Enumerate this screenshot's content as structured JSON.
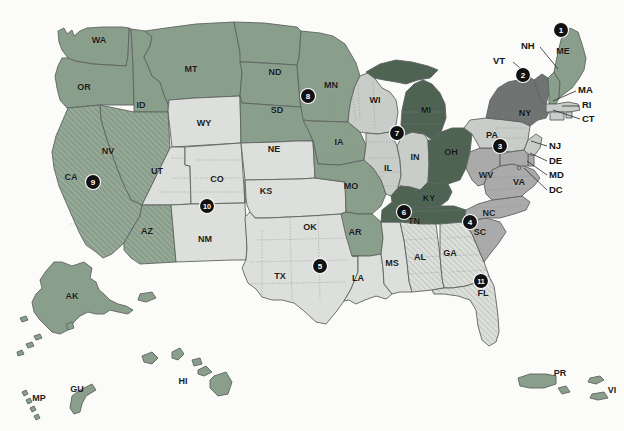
{
  "map": {
    "title": "United States choropleth map with numbered region markers",
    "background_color": "#fbfbfa",
    "legend_colors": {
      "darkest_green": "#4f6352",
      "medium_green": "#8a9e8c",
      "dark_gray": "#6f7472",
      "gray": "#a9aaa9",
      "light_gray": "#c9cdc9",
      "palest_gray": "#dcdfdb",
      "marker_fill": "#111111",
      "marker_text": "#ffffff",
      "border": "#5d6360"
    },
    "states": [
      {
        "code": "WA",
        "x": 99,
        "y": 41,
        "shade": "medium_green"
      },
      {
        "code": "OR",
        "x": 84,
        "y": 88,
        "shade": "medium_green"
      },
      {
        "code": "ID",
        "x": 141,
        "y": 106,
        "shade": "medium_green"
      },
      {
        "code": "MT",
        "x": 191,
        "y": 70,
        "shade": "medium_green"
      },
      {
        "code": "WY",
        "x": 204,
        "y": 124,
        "shade": "palest_gray"
      },
      {
        "code": "NV",
        "x": 108,
        "y": 152,
        "shade": "medium_green_hatched"
      },
      {
        "code": "CA",
        "x": 71,
        "y": 178,
        "shade": "medium_green_hatched"
      },
      {
        "code": "UT",
        "x": 157,
        "y": 172,
        "shade": "palest_gray"
      },
      {
        "code": "CO",
        "x": 217,
        "y": 180,
        "shade": "palest_gray"
      },
      {
        "code": "AZ",
        "x": 147,
        "y": 232,
        "shade": "medium_green_hatched"
      },
      {
        "code": "NM",
        "x": 205,
        "y": 240,
        "shade": "palest_gray"
      },
      {
        "code": "ND",
        "x": 275,
        "y": 73,
        "shade": "medium_green"
      },
      {
        "code": "SD",
        "x": 277,
        "y": 111,
        "shade": "medium_green"
      },
      {
        "code": "NE",
        "x": 274,
        "y": 150,
        "shade": "medium_green"
      },
      {
        "code": "KS",
        "x": 266,
        "y": 192,
        "shade": "palest_gray"
      },
      {
        "code": "OK",
        "x": 310,
        "y": 228,
        "shade": "palest_gray"
      },
      {
        "code": "TX",
        "x": 280,
        "y": 277,
        "shade": "palest_gray"
      },
      {
        "code": "MN",
        "x": 331,
        "y": 86,
        "shade": "medium_green"
      },
      {
        "code": "IA",
        "x": 339,
        "y": 143,
        "shade": "medium_green"
      },
      {
        "code": "MO",
        "x": 351,
        "y": 187,
        "shade": "medium_green"
      },
      {
        "code": "AR",
        "x": 355,
        "y": 233,
        "shade": "medium_green"
      },
      {
        "code": "LA",
        "x": 358,
        "y": 279,
        "shade": "palest_gray"
      },
      {
        "code": "MS",
        "x": 392,
        "y": 264,
        "shade": "palest_gray"
      },
      {
        "code": "WI",
        "x": 375,
        "y": 101,
        "shade": "light_gray"
      },
      {
        "code": "IL",
        "x": 388,
        "y": 169,
        "shade": "light_gray"
      },
      {
        "code": "IN",
        "x": 415,
        "y": 158,
        "shade": "light_gray"
      },
      {
        "code": "MI",
        "x": 426,
        "y": 111,
        "shade": "darkest_green"
      },
      {
        "code": "OH",
        "x": 451,
        "y": 153,
        "shade": "darkest_green"
      },
      {
        "code": "KY",
        "x": 429,
        "y": 199,
        "shade": "darkest_green"
      },
      {
        "code": "TN",
        "x": 414,
        "y": 222,
        "shade": "darkest_green"
      },
      {
        "code": "AL",
        "x": 420,
        "y": 258,
        "shade": "palest_gray_hatched"
      },
      {
        "code": "GA",
        "x": 450,
        "y": 254,
        "shade": "palest_gray_hatched"
      },
      {
        "code": "FL",
        "x": 483,
        "y": 294,
        "shade": "palest_gray_hatched"
      },
      {
        "code": "SC",
        "x": 480,
        "y": 233,
        "shade": "gray"
      },
      {
        "code": "NC",
        "x": 489,
        "y": 214,
        "shade": "gray"
      },
      {
        "code": "VA",
        "x": 519,
        "y": 183,
        "shade": "gray"
      },
      {
        "code": "WV",
        "x": 486,
        "y": 176,
        "shade": "gray"
      },
      {
        "code": "PA",
        "x": 492,
        "y": 136,
        "shade": "light_gray"
      },
      {
        "code": "NY",
        "x": 525,
        "y": 114,
        "shade": "dark_gray"
      },
      {
        "code": "ME",
        "x": 563,
        "y": 52,
        "shade": "medium_green"
      },
      {
        "code": "AK",
        "x": 72,
        "y": 297,
        "shade": "medium_green"
      },
      {
        "code": "HI",
        "x": 183,
        "y": 382,
        "shade": "medium_green"
      },
      {
        "code": "GU",
        "x": 77,
        "y": 390,
        "shade": "medium_green"
      },
      {
        "code": "MP",
        "x": 39,
        "y": 399,
        "shade": "medium_green"
      },
      {
        "code": "PR",
        "x": 560,
        "y": 374,
        "shade": "medium_green"
      },
      {
        "code": "VI",
        "x": 612,
        "y": 391,
        "shade": "medium_green"
      }
    ],
    "leader_labels": [
      {
        "code": "NH",
        "lx": 528,
        "ly": 46,
        "x1": 540,
        "y1": 47,
        "x2": 558,
        "y2": 69
      },
      {
        "code": "VT",
        "lx": 500,
        "ly": 61,
        "x1": 513,
        "y1": 62,
        "x2": 527,
        "y2": 74
      },
      {
        "code": "MA",
        "lx": 578,
        "ly": 90,
        "x1": 576,
        "y1": 91,
        "x2": 553,
        "y2": 101
      },
      {
        "code": "RI",
        "lx": 582,
        "ly": 105,
        "x1": 580,
        "y1": 106,
        "x2": 562,
        "y2": 106
      },
      {
        "code": "CT",
        "lx": 582,
        "ly": 119,
        "x1": 580,
        "y1": 119,
        "x2": 553,
        "y2": 110
      },
      {
        "code": "NJ",
        "lx": 549,
        "ly": 146,
        "x1": 547,
        "y1": 146,
        "x2": 531,
        "y2": 141
      },
      {
        "code": "DE",
        "lx": 549,
        "ly": 161,
        "x1": 547,
        "y1": 161,
        "x2": 530,
        "y2": 153
      },
      {
        "code": "MD",
        "lx": 549,
        "ly": 175,
        "x1": 547,
        "y1": 175,
        "x2": 527,
        "y2": 161
      },
      {
        "code": "DC",
        "lx": 549,
        "ly": 190,
        "x1": 547,
        "y1": 190,
        "x2": 524,
        "y2": 168
      }
    ],
    "markers": [
      {
        "number": "1",
        "x": 561,
        "y": 30
      },
      {
        "number": "2",
        "x": 523,
        "y": 75
      },
      {
        "number": "3",
        "x": 500,
        "y": 146
      },
      {
        "number": "4",
        "x": 470,
        "y": 222
      },
      {
        "number": "5",
        "x": 320,
        "y": 266
      },
      {
        "number": "6",
        "x": 404,
        "y": 212
      },
      {
        "number": "7",
        "x": 397,
        "y": 133
      },
      {
        "number": "8",
        "x": 308,
        "y": 96
      },
      {
        "number": "9",
        "x": 93,
        "y": 182
      },
      {
        "number": "10",
        "x": 207,
        "y": 206
      },
      {
        "number": "11",
        "x": 481,
        "y": 281
      }
    ]
  }
}
